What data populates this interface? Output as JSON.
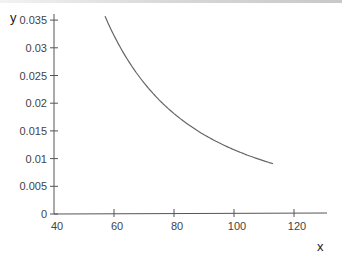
{
  "chart_data": {
    "type": "line",
    "title": "",
    "xlabel": "x",
    "ylabel": "y",
    "xlim": [
      40,
      128
    ],
    "ylim": [
      0,
      0.035
    ],
    "grid": false,
    "legend": null,
    "x_ticks": [
      "40",
      "60",
      "80",
      "100",
      "120"
    ],
    "y_ticks": [
      "0",
      "0.005",
      "0.01",
      "0.015",
      "0.02",
      "0.025",
      "0.03",
      "0.035"
    ],
    "series": [
      {
        "name": "y",
        "formula_estimate": "y = 116 / x^2",
        "color": "#666666",
        "x": [
          57,
          60,
          65,
          70,
          75,
          80,
          85,
          90,
          95,
          100,
          105,
          110,
          113
        ],
        "y": [
          0.0357,
          0.0322,
          0.0275,
          0.0237,
          0.0206,
          0.0181,
          0.0161,
          0.0143,
          0.0129,
          0.0116,
          0.0105,
          0.0096,
          0.0091
        ]
      }
    ]
  }
}
